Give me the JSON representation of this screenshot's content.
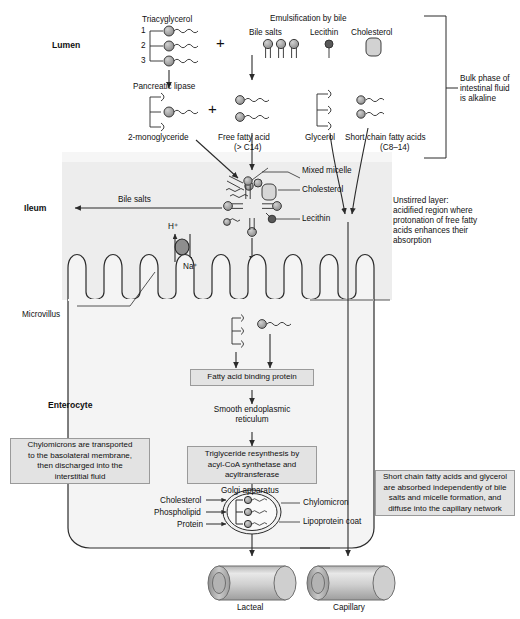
{
  "figure": {
    "width": 520,
    "height": 619
  },
  "regions": {
    "lumen_label": "Lumen",
    "ileum_label": "Ileum",
    "microvillus_label": "Microvillus",
    "enterocyte_label": "Enterocyte"
  },
  "lumen": {
    "triacylglycerol_label": "Triacyglycerol",
    "tag_positions": [
      "1",
      "2",
      "3"
    ],
    "pancreatic_lipase_label": "Pancreatic lipase",
    "monoglyceride_label": "2-monoglyceride",
    "free_fatty_acid_label": "Free fatty acid",
    "free_fatty_acid_sub": "(> C14)",
    "plus_sign": "+",
    "emulsification_title": "Emulsification by bile",
    "bile_salts_label": "Bile salts",
    "lecithin_label": "Lecithin",
    "cholesterol_label": "Cholesterol",
    "glycerol_label": "Glycerol",
    "short_chain_label": "Short chain fatty acids",
    "short_chain_sub": "(C8–14)"
  },
  "bracket": {
    "text": "Bulk phase of\nintestinal fluid\nis alkaline"
  },
  "micelle": {
    "mixed_micelle_label": "Mixed micelle",
    "cholesterol_label": "Cholesterol",
    "lecithin_label": "Lecithin",
    "bile_salts_arrow_label": "Bile salts"
  },
  "exchanger": {
    "proton_label": "H⁺",
    "sodium_label": "Na⁺"
  },
  "unstirred": {
    "text": "Unstirred layer:\nacidified region where\nprotonation of free fatty\nacids enhances their\nabsorption"
  },
  "pathway": {
    "fabp": "Fatty acid binding protein",
    "smooth_er": "Smooth endoplasmic\nreticulum",
    "triglyceride_resynthesis": "Triglyceride resynthesis by\nacyl-CoA synthetase and\nacyltransferase",
    "golgi": "Golgi apparatus"
  },
  "chylomicron": {
    "inputs": [
      "Cholesterol",
      "Phospholipid",
      "Protein"
    ],
    "chylomicron_label": "Chylomicron",
    "lipoprotein_coat_label": "Lipoprotein coat"
  },
  "vessels": {
    "lacteal_label": "Lacteal",
    "capillary_label": "Capillary"
  },
  "notes": {
    "left": "Chylomicrons are transported\nto the basolateral membrane,\nthen discharged into the\ninterstitial fluid",
    "right": "Short chain fatty acids and glycerol\nare absorbed independently of bile\nsalts and micelle formation, and\ndiffuse into the capillary network"
  },
  "colors": {
    "stroke": "#2b2b2b",
    "box_fill": "#e3e3e3",
    "box_border": "#9a9a9a",
    "unstirred_fill": "#ededed",
    "cell_fill": "#f4f4f4",
    "molecule_fill": "#9d9d9d",
    "vessel_fill": "#c9c9c9"
  }
}
